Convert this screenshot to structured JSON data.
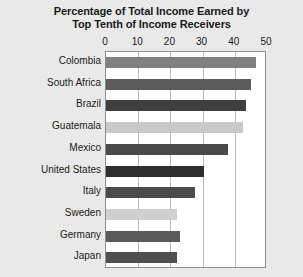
{
  "chart_data": {
    "type": "bar",
    "orientation": "horizontal",
    "title": "Percentage of Total Income Earned by Top Tenth of Income Receivers",
    "title_lines": [
      "Percentage of Total Income Earned by",
      "Top Tenth of Income Receivers"
    ],
    "xlabel": "",
    "ylabel": "",
    "xlim": [
      0,
      50
    ],
    "xticks": [
      0,
      10,
      20,
      30,
      40,
      50
    ],
    "xtick_labels": [
      "0",
      "10",
      "20",
      "30",
      "40",
      "50"
    ],
    "grid": true,
    "legend": false,
    "categories": [
      "Colombia",
      "South Africa",
      "Brazil",
      "Guatemala",
      "Mexico",
      "United States",
      "Italy",
      "Sweden",
      "Germany",
      "Japan"
    ],
    "values": [
      46.5,
      45,
      43.5,
      42.5,
      38,
      30.5,
      27.5,
      22,
      23,
      22
    ],
    "bar_colors": [
      "#808080",
      "#5c5c5c",
      "#3f3f3f",
      "#c9c9c9",
      "#4a4a4a",
      "#2e2e2e",
      "#4a4a4a",
      "#cfcfcf",
      "#5a5a5a",
      "#4f4f4f"
    ]
  },
  "style": {
    "page_background": "#e9e9e9",
    "plot_background": "#ffffff",
    "gridline_color": "#b9b9b9",
    "axis_color": "#8e8e8e",
    "text_color": "#1a1a1a"
  }
}
